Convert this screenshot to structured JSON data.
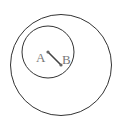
{
  "diagram": {
    "type": "concentric-circles",
    "outer_circle": {
      "cx": 61,
      "cy": 65,
      "r": 51
    },
    "inner_circle": {
      "cx": 48,
      "cy": 52,
      "r": 26
    },
    "segment": {
      "from": "A",
      "to": "B"
    },
    "points": [
      {
        "label": "A",
        "x": 48,
        "y": 52
      },
      {
        "label": "B",
        "x": 61,
        "y": 65
      }
    ],
    "colors": {
      "stroke": "#333333",
      "label": "#777777",
      "segment": "#444444"
    }
  }
}
